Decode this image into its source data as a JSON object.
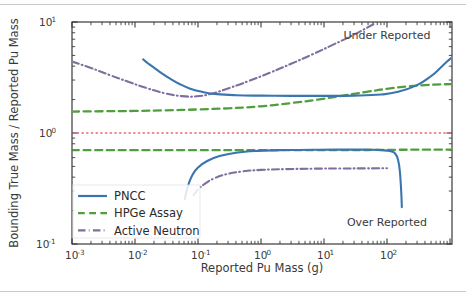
{
  "chart_data": {
    "type": "line",
    "title": "",
    "xlabel": "Reported Pu Mass (g)",
    "ylabel": "Bounding True Mass / Reported Pu Mass",
    "xscale": "log",
    "yscale": "log",
    "xlim": [
      0.001,
      1070
    ],
    "ylim": [
      0.1,
      10
    ],
    "grid": false,
    "legend_position": "lower left",
    "xtick_labels": [
      "10-3",
      "10-2",
      "10-1",
      "100",
      "101",
      "102"
    ],
    "xtick_mantissa": [
      "10",
      "10",
      "10",
      "10",
      "10",
      "10"
    ],
    "xtick_exponents": [
      "-3",
      "-2",
      "-1",
      "0",
      "1",
      "2"
    ],
    "xtick_values": [
      0.001,
      0.01,
      0.1,
      1,
      10,
      100
    ],
    "ytick_mantissa": [
      "10",
      "10",
      "10"
    ],
    "ytick_exponents": [
      "1",
      "0",
      "-1"
    ],
    "ytick_values": [
      10,
      1,
      0.1
    ],
    "annotations": [
      {
        "text": "Under Reported",
        "x": 100,
        "y": 7.1
      },
      {
        "text": "Over Reported",
        "x": 100,
        "y": 0.145
      }
    ],
    "reference_line": {
      "value": 1.0,
      "color": "#e8646e",
      "style": "dotted",
      "label": ""
    },
    "series": [
      {
        "name": "PNCC",
        "color": "#3b75af",
        "style": "solid",
        "width": 2.1,
        "upper": {
          "x": [
            0.0135,
            0.016,
            0.02,
            0.026,
            0.035,
            0.05,
            0.075,
            0.12,
            0.2,
            0.4,
            1.0,
            3.0,
            10,
            30,
            80,
            150,
            300,
            500,
            700,
            900,
            1070
          ],
          "y": [
            4.6,
            4.25,
            3.88,
            3.48,
            3.12,
            2.78,
            2.51,
            2.34,
            2.24,
            2.19,
            2.17,
            2.16,
            2.16,
            2.17,
            2.22,
            2.35,
            2.7,
            3.25,
            3.85,
            4.4,
            4.78
          ]
        },
        "lower": {
          "x": [
            0.062,
            0.066,
            0.072,
            0.082,
            0.1,
            0.14,
            0.22,
            0.4,
            0.9,
            2.5,
            8,
            25,
            60,
            110,
            135,
            150,
            160,
            168,
            172
          ],
          "y": [
            0.255,
            0.3,
            0.355,
            0.42,
            0.49,
            0.56,
            0.62,
            0.665,
            0.69,
            0.702,
            0.707,
            0.708,
            0.706,
            0.69,
            0.65,
            0.57,
            0.45,
            0.3,
            0.215
          ]
        }
      },
      {
        "name": "HPGe Assay",
        "color": "#519e3e",
        "style": "dashed",
        "width": 2.3,
        "upper": {
          "x": [
            0.001,
            0.003,
            0.01,
            0.03,
            0.1,
            0.3,
            1.0,
            3.0,
            8.0,
            20,
            50,
            100,
            200,
            400,
            700,
            1070
          ],
          "y": [
            1.56,
            1.57,
            1.58,
            1.6,
            1.63,
            1.67,
            1.74,
            1.86,
            2.0,
            2.17,
            2.36,
            2.5,
            2.62,
            2.7,
            2.74,
            2.76
          ]
        },
        "lower": {
          "x": [
            0.001,
            0.01,
            0.1,
            1.0,
            10,
            50,
            100,
            150,
            250,
            400,
            700,
            1070
          ],
          "y": [
            0.7,
            0.7,
            0.7,
            0.7,
            0.701,
            0.703,
            0.705,
            0.706,
            0.707,
            0.708,
            0.708,
            0.708
          ]
        }
      },
      {
        "name": "Active Neutron",
        "color": "#7f6f9e",
        "style": "dashdot",
        "width": 2.1,
        "upper": {
          "x": [
            0.001,
            0.002,
            0.004,
            0.008,
            0.016,
            0.03,
            0.055,
            0.095,
            0.17,
            0.32,
            0.65,
            1.4,
            3.0,
            6.5,
            14,
            30,
            62
          ],
          "y": [
            4.4,
            3.85,
            3.32,
            2.88,
            2.52,
            2.28,
            2.15,
            2.14,
            2.27,
            2.55,
            2.95,
            3.5,
            4.2,
            5.1,
            6.25,
            7.7,
            9.6
          ]
        },
        "lower": {
          "x": [
            0.085,
            0.1,
            0.13,
            0.18,
            0.28,
            0.5,
            1.0,
            2.5,
            7,
            18,
            45,
            100
          ],
          "y": [
            0.275,
            0.31,
            0.35,
            0.39,
            0.425,
            0.45,
            0.465,
            0.473,
            0.477,
            0.479,
            0.48,
            0.481
          ]
        }
      }
    ]
  },
  "legend": {
    "items": [
      {
        "label": "PNCC",
        "color": "#3b75af",
        "style": "solid"
      },
      {
        "label": "HPGe Assay",
        "color": "#519e3e",
        "style": "dashed"
      },
      {
        "label": "Active Neutron",
        "color": "#7f6f9e",
        "style": "dashdot"
      }
    ]
  }
}
